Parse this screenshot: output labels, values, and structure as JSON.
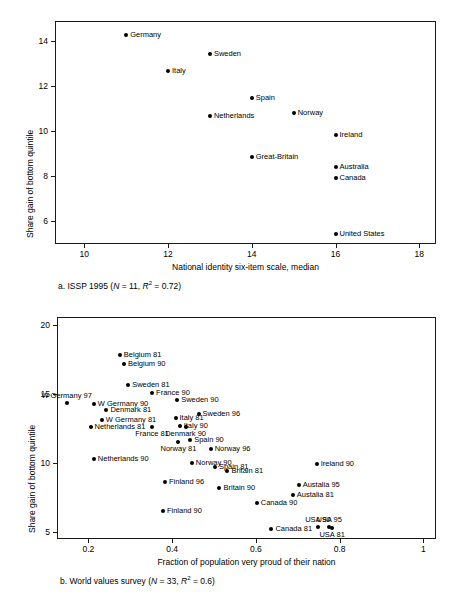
{
  "figure": {
    "panels": [
      {
        "id": "a",
        "caption_prefix": "a. ISSP 1995 (",
        "caption_n_italic": "N",
        "caption_n_value": " = 11, ",
        "caption_r_italic": "R",
        "caption_r_sup": "2",
        "caption_r_value": " = 0.72)",
        "caption_plain": "a. ISSP 1995 (N = 11, R2 = 0.72)",
        "xlabel": "National identity six-item scale, median",
        "ylabel": "Share gain of bottom quintile",
        "xticks": [
          "10",
          "12",
          "14",
          "16",
          "18"
        ],
        "yticks": [
          "14",
          "12",
          "10",
          "8",
          "6"
        ]
      },
      {
        "id": "b",
        "caption_prefix": "b. World values survey (",
        "caption_n_italic": "N",
        "caption_n_value": " = 33, ",
        "caption_r_italic": "R",
        "caption_r_sup": "2",
        "caption_r_value": " = 0.6)",
        "caption_plain": "b. World values survey (N = 33, R2 = 0.6)",
        "xlabel": "Fraction of population very proud of their nation",
        "ylabel": "Share gain of bottom quintile",
        "xticks": [
          "0.2",
          "0.4",
          "0.6",
          "0.8",
          "1"
        ],
        "yticks": [
          "20",
          "15",
          "10",
          "5"
        ]
      }
    ]
  },
  "chart_data": [
    {
      "type": "scatter",
      "panel": "a",
      "title": "a. ISSP 1995 (N = 11, R2 = 0.72)",
      "xlabel": "National identity six-item scale, median",
      "ylabel": "Share gain of bottom quintile",
      "xlim": [
        9.3,
        18.4
      ],
      "ylim": [
        5.0,
        14.9
      ],
      "xticks": [
        10,
        12,
        14,
        16,
        18
      ],
      "yticks": [
        14,
        12,
        10,
        8,
        6
      ],
      "grid": false,
      "legend": "none",
      "points": [
        {
          "label": "Germany",
          "x": 11.0,
          "y": 14.3,
          "pos": "right"
        },
        {
          "label": "Sweden",
          "x": 13.0,
          "y": 13.45,
          "pos": "right"
        },
        {
          "label": "Italy",
          "x": 12.0,
          "y": 12.7,
          "pos": "right"
        },
        {
          "label": "Spain",
          "x": 14.0,
          "y": 11.5,
          "pos": "right"
        },
        {
          "label": "Netherlands",
          "x": 13.0,
          "y": 10.7,
          "pos": "right"
        },
        {
          "label": "Norway",
          "x": 15.0,
          "y": 10.8,
          "pos": "right"
        },
        {
          "label": "Ireland",
          "x": 16.0,
          "y": 9.85,
          "pos": "right"
        },
        {
          "label": "Great-Britain",
          "x": 14.0,
          "y": 8.85,
          "pos": "right"
        },
        {
          "label": "Australia",
          "x": 16.0,
          "y": 8.4,
          "pos": "right"
        },
        {
          "label": "Canada",
          "x": 16.0,
          "y": 7.95,
          "pos": "right"
        },
        {
          "label": "United States",
          "x": 16.0,
          "y": 5.45,
          "pos": "right"
        }
      ]
    },
    {
      "type": "scatter",
      "panel": "b",
      "title": "b. World values survey (N = 33, R2 = 0.6)",
      "xlabel": "Fraction of population very proud of their nation",
      "ylabel": "Share gain of bottom quintile",
      "xlim": [
        0.125,
        1.03
      ],
      "ylim": [
        4.5,
        20.6
      ],
      "xticks": [
        0.2,
        0.4,
        0.6,
        0.8,
        1
      ],
      "yticks": [
        20,
        15,
        10,
        5
      ],
      "grid": false,
      "legend": "none",
      "points": [
        {
          "label": "Belgium 81",
          "x": 0.275,
          "y": 17.85,
          "pos": "right"
        },
        {
          "label": "Belgium 90",
          "x": 0.285,
          "y": 17.2,
          "pos": "right"
        },
        {
          "label": "Sweden 81",
          "x": 0.295,
          "y": 15.65,
          "pos": "right"
        },
        {
          "label": "France 90",
          "x": 0.352,
          "y": 15.1,
          "pos": "right"
        },
        {
          "label": "W Germany 97",
          "x": 0.148,
          "y": 14.35,
          "pos": "above"
        },
        {
          "label": "W Germany 90",
          "x": 0.213,
          "y": 14.3,
          "pos": "right"
        },
        {
          "label": "Sweden 90",
          "x": 0.412,
          "y": 14.55,
          "pos": "right"
        },
        {
          "label": "Denmark 81",
          "x": 0.243,
          "y": 13.85,
          "pos": "right"
        },
        {
          "label": "Sweden 96",
          "x": 0.463,
          "y": 13.55,
          "pos": "right"
        },
        {
          "label": "Italy 81",
          "x": 0.408,
          "y": 13.25,
          "pos": "right"
        },
        {
          "label": "W Germany 81",
          "x": 0.232,
          "y": 13.15,
          "pos": "right"
        },
        {
          "label": "Italy 90",
          "x": 0.418,
          "y": 12.7,
          "pos": "right"
        },
        {
          "label": "Netherlands 81",
          "x": 0.205,
          "y": 12.65,
          "pos": "right"
        },
        {
          "label": "France 81",
          "x": 0.352,
          "y": 12.65,
          "pos": "below"
        },
        {
          "label": "Denmark 90",
          "x": 0.432,
          "y": 12.65,
          "pos": "below"
        },
        {
          "label": "Spain 90",
          "x": 0.443,
          "y": 11.65,
          "pos": "right"
        },
        {
          "label": "Norway 81",
          "x": 0.415,
          "y": 11.5,
          "pos": "below"
        },
        {
          "label": "Norway 96",
          "x": 0.492,
          "y": 11.0,
          "pos": "right"
        },
        {
          "label": "Netherlands 90",
          "x": 0.213,
          "y": 10.3,
          "pos": "right"
        },
        {
          "label": "Ireland 90",
          "x": 0.745,
          "y": 9.95,
          "pos": "right"
        },
        {
          "label": "Norway 90",
          "x": 0.447,
          "y": 10.0,
          "pos": "right"
        },
        {
          "label": "Spain 81",
          "x": 0.502,
          "y": 9.7,
          "pos": "right"
        },
        {
          "label": "Britain 81",
          "x": 0.532,
          "y": 9.4,
          "pos": "right"
        },
        {
          "label": "Finland 96",
          "x": 0.383,
          "y": 8.6,
          "pos": "right"
        },
        {
          "label": "Austalia 95",
          "x": 0.702,
          "y": 8.45,
          "pos": "right"
        },
        {
          "label": "Britain 90",
          "x": 0.513,
          "y": 8.2,
          "pos": "right"
        },
        {
          "label": "Austalia 81",
          "x": 0.688,
          "y": 7.7,
          "pos": "right"
        },
        {
          "label": "Canada 90",
          "x": 0.602,
          "y": 7.1,
          "pos": "right"
        },
        {
          "label": "Finland 90",
          "x": 0.378,
          "y": 6.55,
          "pos": "right"
        },
        {
          "label": "USA 90",
          "x": 0.748,
          "y": 5.4,
          "pos": "above"
        },
        {
          "label": "USA 95",
          "x": 0.775,
          "y": 5.35,
          "pos": "above"
        },
        {
          "label": "USA 81",
          "x": 0.782,
          "y": 5.3,
          "pos": "below"
        },
        {
          "label": "Canada 81",
          "x": 0.637,
          "y": 5.2,
          "pos": "right"
        }
      ]
    }
  ]
}
